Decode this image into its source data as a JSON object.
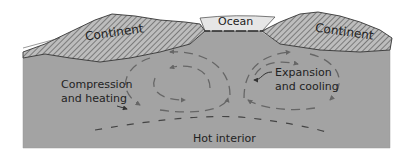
{
  "diagram": {
    "labels": {
      "ocean": "Ocean",
      "continent_left": "Continent",
      "continent_right": "Continent",
      "compression_line1": "Compression",
      "compression_line2": "and heating",
      "expansion_line1": "Expansion",
      "expansion_line2": "and cooling",
      "hot_interior": "Hot interior"
    },
    "colors": {
      "mantle": "#a3a3a3",
      "continent": "#bdbdbd",
      "hatch": "#555555",
      "ocean": "#e6e6e6",
      "outline": "#333333",
      "arrows": "#666666",
      "text": "#222222"
    }
  }
}
